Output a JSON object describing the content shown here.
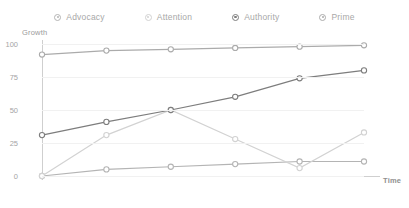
{
  "legend": {
    "position": "top-center",
    "items": [
      {
        "label": "Advocacy",
        "marker": "ring-dot-icon",
        "color": "#b4b4b4"
      },
      {
        "label": "Attention",
        "marker": "ring-dot-icon",
        "color": "#d2d2d2"
      },
      {
        "label": "Authority",
        "marker": "ring-dot-icon",
        "color": "#7d7d7d"
      },
      {
        "label": "Prime",
        "marker": "ring-dot-icon",
        "color": "#ababab"
      }
    ]
  },
  "axes": {
    "y_title": "Growth",
    "x_title": "Time"
  },
  "chart_data": {
    "type": "line",
    "title": "",
    "xlabel": "Time",
    "ylabel": "Growth",
    "categories": [
      "T1",
      "T2",
      "T3",
      "T4",
      "T5",
      "T6"
    ],
    "yticks": [
      0,
      25,
      50,
      75,
      100
    ],
    "ylim": [
      0,
      100
    ],
    "grid": true,
    "legend_position": "top-center",
    "markers": true,
    "series": [
      {
        "name": "Advocacy",
        "color": "#b4b4b4",
        "values": [
          0,
          5,
          7,
          9,
          11,
          11
        ]
      },
      {
        "name": "Attention",
        "color": "#d2d2d2",
        "values": [
          0,
          31,
          50,
          28,
          6,
          33
        ]
      },
      {
        "name": "Authority",
        "color": "#7d7d7d",
        "values": [
          31,
          41,
          50,
          60,
          74,
          80
        ]
      },
      {
        "name": "Prime",
        "color": "#ababab",
        "values": [
          92,
          95,
          96,
          97,
          98,
          99
        ]
      }
    ]
  }
}
